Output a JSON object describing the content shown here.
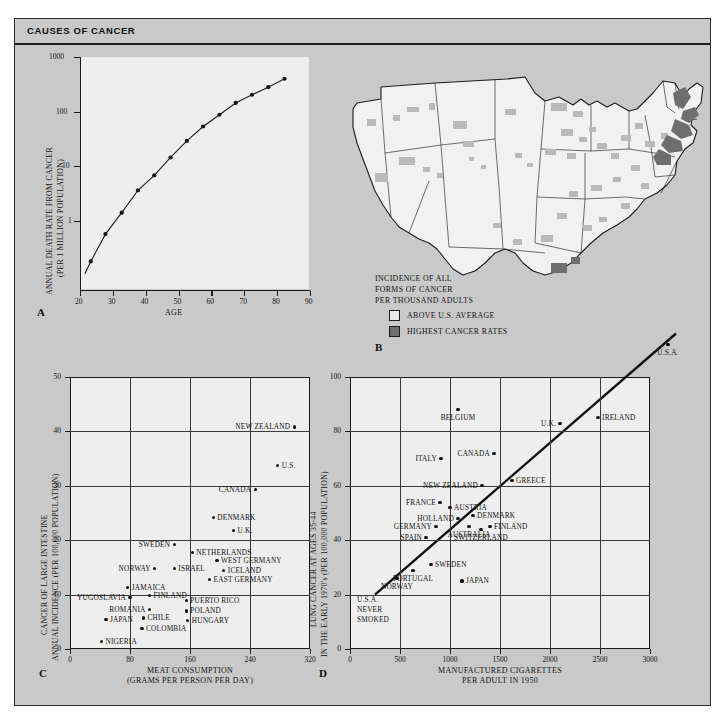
{
  "figure": {
    "title": "CAUSES OF CANCER"
  },
  "panelA": {
    "letter": "A",
    "ylabel_line1": "ANNUAL DEATH RATE FROM CANCER",
    "ylabel_line2": "(PER 1 MILLION POPULATION)",
    "xlabel": "AGE",
    "yticks": [
      "1000",
      "100",
      "10",
      "1"
    ],
    "xticks": [
      "20",
      "30",
      "40",
      "50",
      "60",
      "70",
      "80",
      "90"
    ]
  },
  "panelB": {
    "letter": "B",
    "caption_line1": "INCIDENCE OF ALL",
    "caption_line2": "FORMS OF CANCER",
    "caption_line3": "PER THOUSAND ADULTS",
    "legend": [
      {
        "label": "ABOVE U.S. AVERAGE",
        "color": "#b9b9b9"
      },
      {
        "label": "HIGHEST CANCER RATES",
        "color": "#6e6e6e"
      }
    ]
  },
  "panelC": {
    "letter": "C",
    "ylabel_line1": "CANCER OF LARGE INTESTINE",
    "ylabel_line2": "ANNUAL INCIDENCE (PER 100,000 POPULATION)",
    "xlabel_line1": "MEAT CONSUMPTION",
    "xlabel_line2": "(GRAMS PER PERSON PER DAY)",
    "yticks": [
      "50",
      "40",
      "30",
      "20",
      "10",
      "0"
    ],
    "xticks": [
      "0",
      "80",
      "160",
      "240",
      "320"
    ]
  },
  "panelD": {
    "letter": "D",
    "ylabel_line1": "LUNG CANCER AT AGES 35-44",
    "ylabel_line2": "IN THE EARLY 1970's (PER 100,000 POPULATION)",
    "xlabel_line1": "MANUFACTURED CIGARETTES",
    "xlabel_line2": "PER ADULT IN 1950",
    "yticks": [
      "100",
      "80",
      "60",
      "40",
      "20",
      "0"
    ],
    "xticks": [
      "0",
      "500",
      "1000",
      "1500",
      "2000",
      "2500",
      "3000"
    ],
    "annotation_line1": "U.S.A.",
    "annotation_line2": "NEVER",
    "annotation_line3": "SMOKED"
  },
  "chart_data": [
    {
      "id": "A",
      "type": "line",
      "title": "",
      "xlabel": "AGE",
      "ylabel": "ANNUAL DEATH RATE FROM CANCER (PER 1 MILLION POPULATION)",
      "yscale": "log",
      "xlim": [
        20,
        90
      ],
      "ylim": [
        0.2,
        1000
      ],
      "grid": false,
      "x": [
        23,
        27.5,
        32.5,
        37.5,
        42.5,
        47.5,
        52.5,
        57.5,
        62.5,
        67.5,
        72.5,
        77.5,
        82.5
      ],
      "y": [
        0.55,
        1.5,
        3.3,
        7.5,
        13,
        25,
        46,
        78,
        120,
        185,
        250,
        330,
        450
      ]
    },
    {
      "id": "C",
      "type": "scatter",
      "title": "",
      "xlabel": "MEAT CONSUMPTION (GRAMS PER PERSON PER DAY)",
      "ylabel": "CANCER OF LARGE INTESTINE ANNUAL INCIDENCE (PER 100,000 POPULATION)",
      "xlim": [
        0,
        320
      ],
      "ylim": [
        0,
        50
      ],
      "grid": true,
      "points": [
        {
          "label": "NEW ZEALAND",
          "x": 299,
          "y": 40.8,
          "lpos": "left"
        },
        {
          "label": "U.S.",
          "x": 277,
          "y": 33.8,
          "lpos": "right"
        },
        {
          "label": "CANADA",
          "x": 247,
          "y": 29.3,
          "lpos": "left"
        },
        {
          "label": "DENMARK",
          "x": 191,
          "y": 24.2,
          "lpos": "right"
        },
        {
          "label": "U.K.",
          "x": 218,
          "y": 21.8,
          "lpos": "right"
        },
        {
          "label": "SWEDEN",
          "x": 139,
          "y": 19.2,
          "lpos": "left"
        },
        {
          "label": "NETHERLANDS",
          "x": 163,
          "y": 17.7,
          "lpos": "right"
        },
        {
          "label": "WEST GERMANY",
          "x": 196,
          "y": 16.3,
          "lpos": "right"
        },
        {
          "label": "NORWAY",
          "x": 113,
          "y": 14.8,
          "lpos": "left"
        },
        {
          "label": "ISRAEL",
          "x": 139,
          "y": 14.8,
          "lpos": "right"
        },
        {
          "label": "ICELAND",
          "x": 205,
          "y": 14.5,
          "lpos": "right"
        },
        {
          "label": "JAMAICA",
          "x": 77,
          "y": 11.3,
          "lpos": "right"
        },
        {
          "label": "EAST GERMANY",
          "x": 186,
          "y": 12.8,
          "lpos": "right"
        },
        {
          "label": "YUGOSLAVIA",
          "x": 80,
          "y": 9.4,
          "lpos": "left"
        },
        {
          "label": "FINLAND",
          "x": 106,
          "y": 9.9,
          "lpos": "right"
        },
        {
          "label": "PUERTO RICO",
          "x": 155,
          "y": 8.9,
          "lpos": "right"
        },
        {
          "label": "ROMANIA",
          "x": 106,
          "y": 7.3,
          "lpos": "left"
        },
        {
          "label": "POLAND",
          "x": 155,
          "y": 7.0,
          "lpos": "right"
        },
        {
          "label": "CHILE",
          "x": 98,
          "y": 5.7,
          "lpos": "right"
        },
        {
          "label": "JAPAN",
          "x": 48,
          "y": 5.4,
          "lpos": "right"
        },
        {
          "label": "HUNGARY",
          "x": 157,
          "y": 5.3,
          "lpos": "right"
        },
        {
          "label": "COLOMBIA",
          "x": 96,
          "y": 3.7,
          "lpos": "right"
        },
        {
          "label": "NIGERIA",
          "x": 42,
          "y": 1.4,
          "lpos": "right"
        }
      ]
    },
    {
      "id": "D",
      "type": "scatter",
      "title": "",
      "xlabel": "MANUFACTURED CIGARETTES PER ADULT IN 1950",
      "ylabel": "LUNG CANCER AT AGES 35-44 IN THE EARLY 1970's (PER 100,000 POPULATION)",
      "xlim": [
        0,
        3000
      ],
      "ylim": [
        0,
        100
      ],
      "grid": true,
      "fit_line": {
        "x0": 250,
        "y0": 20,
        "x1": 3000,
        "y1": 108
      },
      "points": [
        {
          "label": "U.S.A.",
          "x": 3180,
          "y": 112,
          "lpos": "below",
          "outside": true
        },
        {
          "label": "IRELAND",
          "x": 2480,
          "y": 85,
          "lpos": "right"
        },
        {
          "label": "BELGIUM",
          "x": 1080,
          "y": 88,
          "lpos": "below"
        },
        {
          "label": "U.K.",
          "x": 2100,
          "y": 83,
          "lpos": "left"
        },
        {
          "label": "CANADA",
          "x": 1440,
          "y": 72,
          "lpos": "left"
        },
        {
          "label": "ITALY",
          "x": 910,
          "y": 70,
          "lpos": "left"
        },
        {
          "label": "GREECE",
          "x": 1620,
          "y": 62,
          "lpos": "right"
        },
        {
          "label": "NEW ZEALAND",
          "x": 1320,
          "y": 60,
          "lpos": "left"
        },
        {
          "label": "FRANCE",
          "x": 900,
          "y": 54,
          "lpos": "left"
        },
        {
          "label": "AUSTRIA",
          "x": 1000,
          "y": 52,
          "lpos": "right"
        },
        {
          "label": "DENMARK",
          "x": 1230,
          "y": 49,
          "lpos": "right"
        },
        {
          "label": "HOLLAND",
          "x": 1080,
          "y": 48,
          "lpos": "left"
        },
        {
          "label": "GERMANY",
          "x": 860,
          "y": 45,
          "lpos": "left"
        },
        {
          "label": "FINLAND",
          "x": 1400,
          "y": 45,
          "lpos": "right"
        },
        {
          "label": "AUSTRALIA",
          "x": 1190,
          "y": 45,
          "lpos": "below"
        },
        {
          "label": "SWITZERLAND",
          "x": 1310,
          "y": 44,
          "lpos": "below"
        },
        {
          "label": "SPAIN",
          "x": 760,
          "y": 41,
          "lpos": "left"
        },
        {
          "label": "SWEDEN",
          "x": 810,
          "y": 31,
          "lpos": "right"
        },
        {
          "label": "PORTUGAL",
          "x": 630,
          "y": 29,
          "lpos": "below"
        },
        {
          "label": "NORWAY",
          "x": 470,
          "y": 26,
          "lpos": "below"
        },
        {
          "label": "JAPAN",
          "x": 1120,
          "y": 25,
          "lpos": "right"
        }
      ]
    }
  ]
}
